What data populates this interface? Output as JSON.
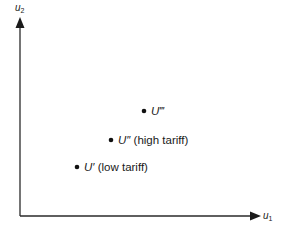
{
  "diagram": {
    "type": "utility-possibility-points",
    "axes": {
      "y": {
        "label_base": "u",
        "label_sub": "2"
      },
      "x": {
        "label_base": "u",
        "label_sub": "1"
      }
    },
    "points": [
      {
        "id": "u-triple-prime",
        "symbol": "U‴",
        "note": "",
        "x": 144,
        "y": 111
      },
      {
        "id": "u-double-prime",
        "symbol": "U″",
        "note": "(high tariff)",
        "x": 111,
        "y": 140
      },
      {
        "id": "u-prime",
        "symbol": "U′",
        "note": "(low tariff)",
        "x": 77,
        "y": 167
      }
    ],
    "colors": {
      "ink": "#1a1a1a",
      "background": "#ffffff"
    }
  }
}
